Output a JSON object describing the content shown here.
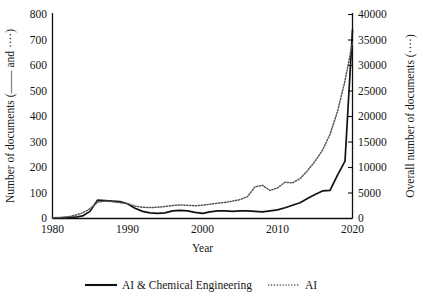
{
  "chart_data": {
    "type": "line",
    "title": "",
    "xlabel": "Year",
    "ylabel_left": "Number of documents (—— and ····)",
    "ylabel_right": "Overall number of documents (····)",
    "xlim": [
      1980,
      2020
    ],
    "ylim_left": [
      0,
      800
    ],
    "ylim_right": [
      0,
      40000
    ],
    "xticks": [
      "1980",
      "1990",
      "2000",
      "2010",
      "2020"
    ],
    "yticks_left": [
      "0",
      "100",
      "200",
      "300",
      "400",
      "500",
      "600",
      "700",
      "800"
    ],
    "yticks_right": [
      "0",
      "5000",
      "10000",
      "15000",
      "20000",
      "25000",
      "30000",
      "35000",
      "40000"
    ],
    "grid": false,
    "legend_position": "bottom",
    "x": [
      1980,
      1981,
      1982,
      1983,
      1984,
      1985,
      1986,
      1987,
      1988,
      1989,
      1990,
      1991,
      1992,
      1993,
      1994,
      1995,
      1996,
      1997,
      1998,
      1999,
      2000,
      2001,
      2002,
      2003,
      2004,
      2005,
      2006,
      2007,
      2008,
      2009,
      2010,
      2011,
      2012,
      2013,
      2014,
      2015,
      2016,
      2017,
      2018,
      2019,
      2020
    ],
    "series": [
      {
        "name": "AI & Chemical Engineering",
        "style": "solid",
        "axis": "left",
        "values": [
          2,
          3,
          4,
          5,
          10,
          28,
          72,
          70,
          68,
          66,
          58,
          40,
          28,
          22,
          20,
          22,
          30,
          32,
          30,
          24,
          20,
          26,
          30,
          30,
          28,
          30,
          30,
          28,
          26,
          30,
          34,
          42,
          52,
          62,
          78,
          94,
          108,
          110,
          170,
          225,
          740
        ]
      },
      {
        "name": "AI",
        "style": "dotted",
        "axis": "right",
        "values": [
          150,
          220,
          330,
          620,
          1100,
          1900,
          3200,
          3400,
          3300,
          3100,
          2900,
          2450,
          2200,
          2150,
          2200,
          2350,
          2550,
          2650,
          2600,
          2500,
          2600,
          2800,
          3000,
          3150,
          3400,
          3700,
          4300,
          6200,
          6500,
          5500,
          6000,
          7100,
          7000,
          7800,
          9400,
          11200,
          13400,
          16500,
          21000,
          27000,
          34500
        ]
      }
    ]
  },
  "legend": {
    "items": [
      {
        "label": "AI & Chemical Engineering",
        "style": "solid"
      },
      {
        "label": "AI",
        "style": "dotted"
      }
    ]
  }
}
